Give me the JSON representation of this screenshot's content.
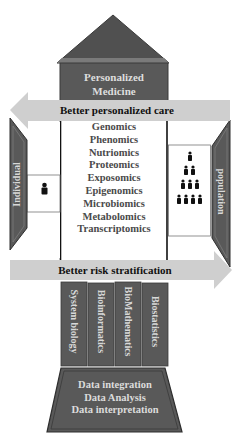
{
  "roof": {
    "title_line1": "Personalized",
    "title_line2": "Medicine"
  },
  "arrow_top": {
    "label": "Better personalized care",
    "direction": "left"
  },
  "arrow_bottom": {
    "label": "Better risk stratification",
    "direction": "right"
  },
  "omics": [
    "Genomics",
    "Phenomics",
    "Nutriomics",
    "Proteomics",
    "Exposomics",
    "Epigenomics",
    "Microbiomics",
    "Metabolomics",
    "Transcriptomics"
  ],
  "wings": {
    "left": {
      "label": "Individual",
      "icon": "person-icon"
    },
    "right": {
      "label": "population",
      "icon": "population-pyramid-icon",
      "rows": [
        1,
        2,
        3,
        4
      ]
    }
  },
  "pillars": [
    "System biology",
    "Bioinformatics",
    "BioMathematics",
    "Biostatistics"
  ],
  "base": {
    "lines": [
      "Data integration",
      "Data Analysis",
      "Data interpretation"
    ]
  },
  "colors": {
    "dark_fill": "#595959",
    "roof_fill": "#505050",
    "arrow_fill": "#cfcfcf",
    "light_text": "#dcdcdc",
    "omics_text": "#4a4a4a"
  }
}
